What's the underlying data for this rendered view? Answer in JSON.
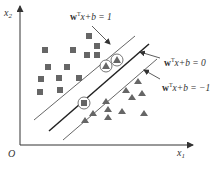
{
  "diagram": {
    "axes": {
      "x_label": "x",
      "x_sub": "1",
      "y_label": "x",
      "y_sub": "2",
      "origin": "O"
    },
    "hyperplanes": [
      {
        "name": "positive-margin",
        "label_w": "w",
        "label_sup": "T",
        "label_rest": "x+b = 1"
      },
      {
        "name": "decision-boundary",
        "label_w": "w",
        "label_sup": "T",
        "label_rest": "x+b = 0"
      },
      {
        "name": "negative-margin",
        "label_w": "w",
        "label_sup": "T",
        "label_rest": "x+b = −1"
      }
    ],
    "classes": [
      {
        "name": "squares",
        "marker": "square",
        "color": "#666666",
        "count": 14
      },
      {
        "name": "triangles",
        "marker": "triangle",
        "color": "#666666",
        "count": 13
      }
    ],
    "support_vectors": {
      "marker": "circle",
      "count": 3
    }
  }
}
